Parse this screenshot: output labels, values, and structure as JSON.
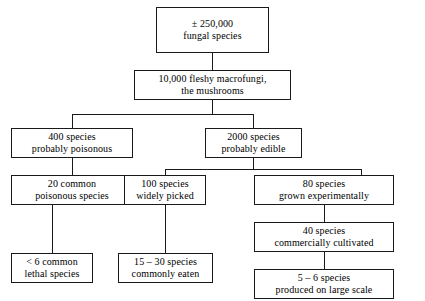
{
  "diagram": {
    "type": "flowchart",
    "nodes": [
      {
        "id": "n1",
        "lines": [
          "± 250,000",
          "fungal species"
        ]
      },
      {
        "id": "n2",
        "lines": [
          "10,000 fleshy macrofungi,",
          "the mushrooms"
        ]
      },
      {
        "id": "n3",
        "lines": [
          "400 species",
          "probably poisonous"
        ]
      },
      {
        "id": "n4",
        "lines": [
          "2000 species",
          "probably edible"
        ]
      },
      {
        "id": "n5",
        "lines": [
          "20 common",
          "poisonous species"
        ]
      },
      {
        "id": "n6",
        "lines": [
          "100 species",
          "widely picked"
        ]
      },
      {
        "id": "n7",
        "lines": [
          "80 species",
          "grown experimentally"
        ]
      },
      {
        "id": "n8",
        "lines": [
          "< 6 common",
          "lethal species"
        ]
      },
      {
        "id": "n9",
        "lines": [
          "15 – 30 species",
          "commonly eaten"
        ]
      },
      {
        "id": "n10",
        "lines": [
          "40 species",
          "commercially cultivated"
        ]
      },
      {
        "id": "n11",
        "lines": [
          "5 – 6 species",
          "produced on large scale"
        ]
      }
    ],
    "colors": {
      "line": "#1a1a1a",
      "text": "#000000",
      "background": "#ffffff"
    }
  }
}
